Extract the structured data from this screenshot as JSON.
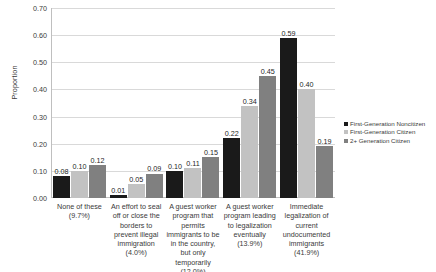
{
  "chart_data": {
    "type": "bar",
    "title": "",
    "xlabel": "",
    "ylabel": "Proportion",
    "ylim": [
      0,
      0.7
    ],
    "ytick_step": 0.1,
    "ytick_labels": [
      "0.70",
      "0.60",
      "0.50",
      "0.40",
      "0.30",
      "0.20",
      "0.10",
      "0.00"
    ],
    "grid": true,
    "legend_position": "right",
    "categories": [
      "None of these (9.7%)",
      "An effort to seal off or close the borders to prevent illegal immigration (4.0%)",
      "A guest worker program that permits immigrants to be in the country, but only temporarily (12.0%)",
      "A guest worker program leading to legalization eventually (13.9%)",
      "Immediate legalization of current undocumented immigrants (41.9%)"
    ],
    "series": [
      {
        "name": "First-Generation Noncitizen",
        "color": "#1a1a1a",
        "values": [
          0.08,
          0.01,
          0.1,
          0.22,
          0.59
        ],
        "labels": [
          "0.08",
          "0.01",
          "0.10",
          "0.22",
          "0.59"
        ]
      },
      {
        "name": "First-Generation Citizen",
        "color": "#c2c2c2",
        "values": [
          0.1,
          0.05,
          0.11,
          0.34,
          0.4
        ],
        "labels": [
          "0.10",
          "0.05",
          "0.11",
          "0.34",
          "0.40"
        ]
      },
      {
        "name": "2+ Generation Citizen",
        "color": "#808080",
        "values": [
          0.12,
          0.09,
          0.15,
          0.45,
          0.19
        ],
        "labels": [
          "0.12",
          "0.09",
          "0.15",
          "0.45",
          "0.19"
        ]
      }
    ]
  },
  "legend": {
    "items": [
      {
        "label": "First-Generation Noncitizen",
        "color": "#1a1a1a"
      },
      {
        "label": "First-Generation Citizen",
        "color": "#c2c2c2"
      },
      {
        "label": "2+ Generation Citizen",
        "color": "#808080"
      }
    ]
  }
}
